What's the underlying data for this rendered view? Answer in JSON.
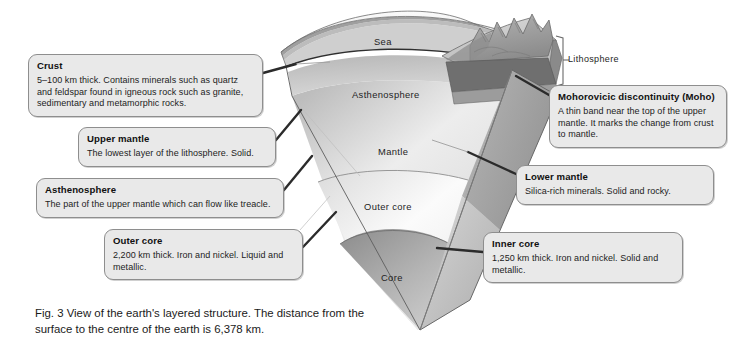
{
  "figure": {
    "caption": "Fig. 3  View of the earth's layered structure. The distance from the surface to the centre of the earth is 6,378 km."
  },
  "diagram": {
    "internal_labels": {
      "sea": "Sea",
      "asthenosphere": "Asthenosphere",
      "mantle": "Mantle",
      "outer_core": "Outer core",
      "core": "Core",
      "lithosphere": "Lithosphere"
    },
    "colors": {
      "sea_surface": "#f1f1f1",
      "crust_top": "#d8d8d8",
      "mountains": "#9a9a9a",
      "moho_band": "#3a3a3a",
      "asthenosphere": "#c2c2c2",
      "mantle": "#ececec",
      "outer_core": "#f5f5f5",
      "core": "#a8a8a8",
      "cut_face": "#bdbdbd",
      "outline": "#4a4a4a",
      "leader_line": "#2e2e2e",
      "callout_fill": "#e9e9e9",
      "callout_border": "#8e8e8e"
    }
  },
  "callouts": [
    {
      "id": "crust",
      "title": "Crust",
      "body": "5–100 km thick. Contains minerals such as quartz and feldspar found in igneous rock such as granite, sedimentary and metamorphic rocks."
    },
    {
      "id": "upper_mantle",
      "title": "Upper mantle",
      "body": "The lowest layer of the lithosphere. Solid."
    },
    {
      "id": "asthenosphere",
      "title": "Asthenosphere",
      "body": "The part of the upper mantle which can flow like treacle."
    },
    {
      "id": "outer_core",
      "title": "Outer core",
      "body": "2,200 km thick. Iron and nickel. Liquid and metallic."
    },
    {
      "id": "moho",
      "title": "Mohorovicic discontinuity (Moho)",
      "body": "A thin band near the top of the upper mantle. It marks the change from crust to mantle."
    },
    {
      "id": "lower_mantle",
      "title": "Lower mantle",
      "body": "Silica-rich minerals. Solid and rocky."
    },
    {
      "id": "inner_core",
      "title": "Inner core",
      "body": "1,250 km thick. Iron and nickel. Solid and metallic."
    }
  ]
}
